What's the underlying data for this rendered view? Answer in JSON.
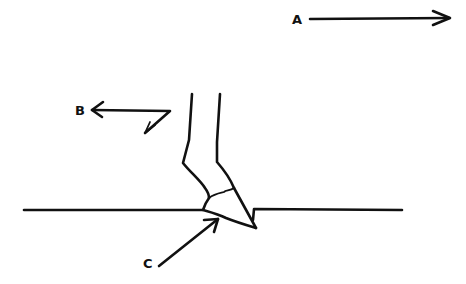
{
  "diagram": {
    "type": "force diagram (hand-drawn)",
    "labels": {
      "a": "A",
      "b": "B",
      "c": "C"
    },
    "colors": {
      "ink": "#111111",
      "background": "#ffffff"
    }
  }
}
